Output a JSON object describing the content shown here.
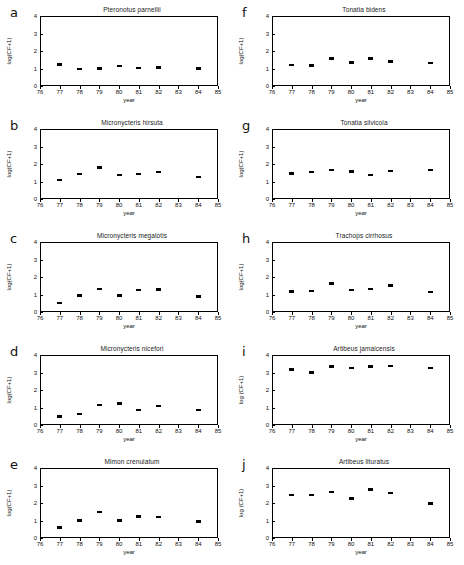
{
  "figure": {
    "columns": 2,
    "rows": 5,
    "panel_count": 10
  },
  "axes": {
    "xlabel": "year",
    "ylabel_default": "log(CF+1)",
    "ylabel_alt": "log (CF+1)",
    "xticks": [
      "76",
      "77",
      "78",
      "79",
      "80",
      "81",
      "82",
      "83",
      "84",
      "85"
    ],
    "yticks": [
      "0",
      "1",
      "2",
      "3",
      "4"
    ],
    "xlim": [
      76,
      85
    ],
    "ylim": [
      0,
      4
    ],
    "grid": false,
    "marker_color": "#000000",
    "axis_color": "#000000"
  },
  "chart_data": [
    {
      "type": "scatter",
      "panel": "a",
      "title": "Pteronotus parnellii",
      "xlabel": "year",
      "ylabel": "log(CF+1)",
      "xlim": [
        76,
        85
      ],
      "ylim": [
        0,
        4
      ],
      "x": [
        77,
        78,
        79,
        80,
        81,
        82,
        84
      ],
      "y": [
        1.22,
        0.96,
        1.0,
        1.14,
        1.04,
        1.05,
        1.0
      ]
    },
    {
      "type": "scatter",
      "panel": "b",
      "title": "Micronycteris hirsuta",
      "xlabel": "year",
      "ylabel": "log(CF+1)",
      "xlim": [
        76,
        85
      ],
      "ylim": [
        0,
        4
      ],
      "x": [
        77,
        78,
        79,
        80,
        81,
        82,
        84
      ],
      "y": [
        1.1,
        1.42,
        1.8,
        1.38,
        1.42,
        1.54,
        1.26
      ]
    },
    {
      "type": "scatter",
      "panel": "c",
      "title": "Micronycteris megalotis",
      "xlabel": "year",
      "ylabel": "log(CF+1)",
      "xlim": [
        76,
        85
      ],
      "ylim": [
        0,
        4
      ],
      "x": [
        77,
        78,
        79,
        80,
        81,
        82,
        84
      ],
      "y": [
        0.52,
        0.94,
        1.31,
        0.95,
        1.25,
        1.3,
        0.9
      ]
    },
    {
      "type": "scatter",
      "panel": "d",
      "title": "Micronycteris nicefori",
      "xlabel": "year",
      "ylabel": "log(CF+1)",
      "xlim": [
        76,
        85
      ],
      "ylim": [
        0,
        4
      ],
      "x": [
        77,
        78,
        79,
        80,
        81,
        82,
        84
      ],
      "y": [
        0.48,
        0.62,
        1.13,
        1.22,
        0.87,
        1.08,
        0.87
      ]
    },
    {
      "type": "scatter",
      "panel": "e",
      "title": "Mimon crenulatum",
      "xlabel": "year",
      "ylabel": "log(CF+1)",
      "xlim": [
        76,
        85
      ],
      "ylim": [
        0,
        4
      ],
      "x": [
        77,
        78,
        79,
        80,
        81,
        82,
        84
      ],
      "y": [
        0.61,
        1.0,
        1.48,
        1.0,
        1.22,
        1.19,
        0.95
      ]
    },
    {
      "type": "scatter",
      "panel": "f",
      "title": "Tonatia bidens",
      "xlabel": "year",
      "ylabel": "log(CF+1)",
      "xlim": [
        76,
        85
      ],
      "ylim": [
        0,
        4
      ],
      "x": [
        77,
        78,
        79,
        80,
        81,
        82,
        84
      ],
      "y": [
        1.2,
        1.17,
        1.57,
        1.35,
        1.57,
        1.4,
        1.32
      ]
    },
    {
      "type": "scatter",
      "panel": "g",
      "title": "Tonatia silvicola",
      "xlabel": "year",
      "ylabel": "log(CF+1)",
      "xlim": [
        76,
        85
      ],
      "ylim": [
        0,
        4
      ],
      "x": [
        77,
        78,
        79,
        80,
        81,
        82,
        84
      ],
      "y": [
        1.45,
        1.54,
        1.66,
        1.58,
        1.38,
        1.6,
        1.67
      ]
    },
    {
      "type": "scatter",
      "panel": "h",
      "title": "Trachops cirrhosus",
      "xlabel": "year",
      "ylabel": "log(CF+1)",
      "xlim": [
        76,
        85
      ],
      "ylim": [
        0,
        4
      ],
      "x": [
        77,
        78,
        79,
        80,
        81,
        82,
        84
      ],
      "y": [
        1.17,
        1.2,
        1.62,
        1.27,
        1.32,
        1.52,
        1.15
      ]
    },
    {
      "type": "scatter",
      "panel": "i",
      "title": "Artibeus jamaicensis",
      "xlabel": "year",
      "ylabel": "log (CF+1)",
      "xlim": [
        76,
        85
      ],
      "ylim": [
        0,
        4
      ],
      "x": [
        77,
        78,
        79,
        80,
        81,
        82,
        84
      ],
      "y": [
        3.18,
        3.0,
        3.35,
        3.26,
        3.33,
        3.38,
        3.27
      ]
    },
    {
      "type": "scatter",
      "panel": "j",
      "title": "Artibeus lituratus",
      "xlabel": "year",
      "ylabel": "log (CF+1)",
      "xlim": [
        76,
        85
      ],
      "ylim": [
        0,
        4
      ],
      "x": [
        77,
        78,
        79,
        80,
        81,
        82,
        84
      ],
      "y": [
        2.45,
        2.46,
        2.62,
        2.25,
        2.78,
        2.57,
        1.96
      ]
    }
  ]
}
